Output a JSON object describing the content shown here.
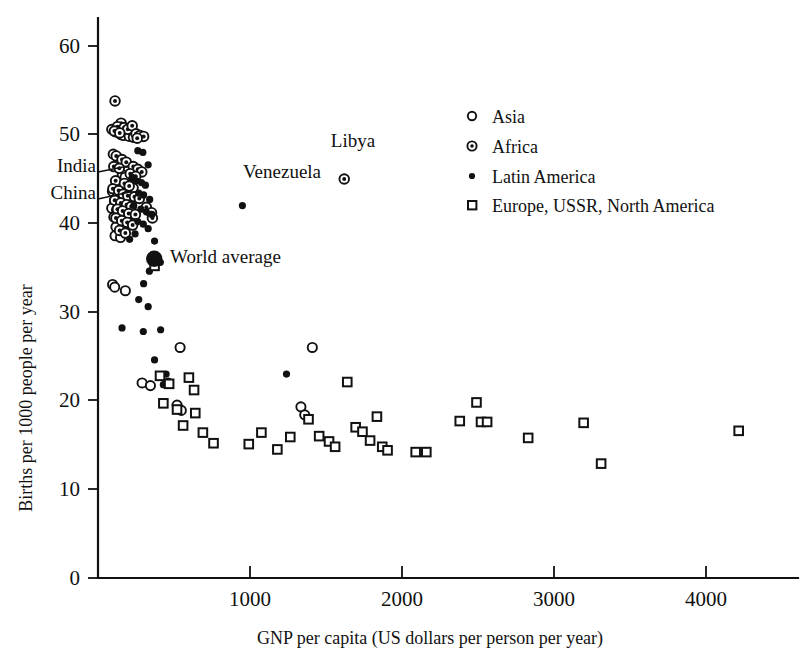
{
  "chart_data": {
    "type": "scatter",
    "title": "",
    "xlabel": "GNP per capita (US dollars per person per year)",
    "ylabel": "Births per 1000 people per year",
    "xlim": [
      0,
      4650
    ],
    "ylim": [
      0,
      62
    ],
    "xticks": [
      0,
      1000,
      2000,
      3000,
      4000
    ],
    "xtick_labels": [
      "",
      "1000",
      "2000",
      "3000",
      "4000"
    ],
    "yticks": [
      0,
      10,
      20,
      30,
      40,
      50,
      60
    ],
    "ytick_labels": [
      "0",
      "10",
      "20",
      "30",
      "40",
      "50",
      "60"
    ],
    "grid": false,
    "legend_position": "upper-right",
    "legend": [
      {
        "key": "asia",
        "label": "Asia",
        "marker": "open-circle"
      },
      {
        "key": "africa",
        "label": "Africa",
        "marker": "circle-with-dot"
      },
      {
        "key": "latin",
        "label": "Latin America",
        "marker": "filled-dot"
      },
      {
        "key": "europe",
        "label": "Europe, USSR, North America",
        "marker": "open-square"
      }
    ],
    "series": [
      {
        "name": "Asia",
        "marker": "open-circle",
        "points": [
          [
            90,
            50.6
          ],
          [
            118,
            50.3
          ],
          [
            150,
            50.0
          ],
          [
            168,
            49.9
          ],
          [
            205,
            49.8
          ],
          [
            232,
            49.7
          ],
          [
            100,
            47.8
          ],
          [
            135,
            47.0
          ],
          [
            160,
            45.5
          ],
          [
            178,
            45.2
          ],
          [
            120,
            44.6
          ],
          [
            145,
            44.3
          ],
          [
            200,
            44.4
          ],
          [
            232,
            44.0
          ],
          [
            95,
            43.6
          ],
          [
            128,
            43.4
          ],
          [
            175,
            43.5
          ],
          [
            148,
            43.0
          ],
          [
            190,
            42.9
          ],
          [
            108,
            42.5
          ],
          [
            132,
            42.4
          ],
          [
            166,
            42.2
          ],
          [
            205,
            42.0
          ],
          [
            220,
            42.0
          ],
          [
            90,
            41.7
          ],
          [
            122,
            41.5
          ],
          [
            152,
            41.4
          ],
          [
            183,
            41.2
          ],
          [
            215,
            41.0
          ],
          [
            104,
            40.7
          ],
          [
            140,
            40.5
          ],
          [
            172,
            40.4
          ],
          [
            198,
            40.2
          ],
          [
            118,
            39.6
          ],
          [
            158,
            39.4
          ],
          [
            112,
            38.6
          ],
          [
            148,
            38.4
          ],
          [
            96,
            33.1
          ],
          [
            110,
            32.8
          ],
          [
            180,
            32.4
          ],
          [
            370,
            36.2
          ],
          [
            290,
            22.0
          ],
          [
            345,
            21.7
          ],
          [
            540,
            26.0
          ],
          [
            520,
            19.5
          ],
          [
            548,
            18.9
          ],
          [
            1410,
            26.0
          ],
          [
            1335,
            19.3
          ],
          [
            1360,
            18.4
          ]
        ]
      },
      {
        "name": "Africa",
        "marker": "circle-with-dot",
        "points": [
          [
            112,
            53.8
          ],
          [
            152,
            51.3
          ],
          [
            128,
            50.9
          ],
          [
            172,
            50.8
          ],
          [
            196,
            50.6
          ],
          [
            108,
            50.4
          ],
          [
            143,
            50.2
          ],
          [
            225,
            51.0
          ],
          [
            250,
            50.1
          ],
          [
            276,
            49.9
          ],
          [
            300,
            49.8
          ],
          [
            258,
            49.6
          ],
          [
            120,
            47.6
          ],
          [
            158,
            47.2
          ],
          [
            186,
            46.9
          ],
          [
            104,
            46.4
          ],
          [
            140,
            46.2
          ],
          [
            232,
            46.4
          ],
          [
            262,
            46.1
          ],
          [
            288,
            45.8
          ],
          [
            212,
            45.6
          ],
          [
            248,
            45.3
          ],
          [
            116,
            44.8
          ],
          [
            174,
            44.5
          ],
          [
            205,
            44.2
          ],
          [
            98,
            43.9
          ],
          [
            136,
            43.7
          ],
          [
            166,
            43.3
          ],
          [
            196,
            43.1
          ],
          [
            240,
            43.0
          ],
          [
            272,
            42.8
          ],
          [
            110,
            42.6
          ],
          [
            150,
            42.3
          ],
          [
            188,
            42.1
          ],
          [
            218,
            41.9
          ],
          [
            128,
            41.6
          ],
          [
            162,
            41.4
          ],
          [
            202,
            41.1
          ],
          [
            246,
            41.0
          ],
          [
            118,
            40.6
          ],
          [
            156,
            40.3
          ],
          [
            192,
            40.1
          ],
          [
            228,
            39.8
          ],
          [
            142,
            39.2
          ],
          [
            180,
            38.9
          ],
          [
            318,
            41.8
          ],
          [
            352,
            41.2
          ],
          [
            358,
            40.6
          ],
          [
            1620,
            45.0
          ]
        ]
      },
      {
        "name": "Latin America",
        "marker": "filled-dot",
        "points": [
          [
            262,
            48.2
          ],
          [
            295,
            48.0
          ],
          [
            330,
            46.6
          ],
          [
            225,
            45.2
          ],
          [
            252,
            44.8
          ],
          [
            286,
            44.6
          ],
          [
            312,
            44.3
          ],
          [
            268,
            43.4
          ],
          [
            300,
            43.2
          ],
          [
            340,
            42.7
          ],
          [
            235,
            42.0
          ],
          [
            282,
            41.6
          ],
          [
            318,
            41.3
          ],
          [
            355,
            41.0
          ],
          [
            262,
            40.2
          ],
          [
            298,
            39.9
          ],
          [
            330,
            39.4
          ],
          [
            244,
            38.8
          ],
          [
            208,
            38.2
          ],
          [
            372,
            38.0
          ],
          [
            410,
            35.6
          ],
          [
            338,
            34.6
          ],
          [
            300,
            33.2
          ],
          [
            268,
            31.4
          ],
          [
            330,
            30.6
          ],
          [
            158,
            28.2
          ],
          [
            412,
            28.0
          ],
          [
            298,
            27.8
          ],
          [
            372,
            24.6
          ],
          [
            448,
            23.0
          ],
          [
            462,
            22.2
          ],
          [
            430,
            21.8
          ],
          [
            950,
            42.0
          ],
          [
            1240,
            23.0
          ]
        ]
      },
      {
        "name": "Europe, USSR, North America",
        "marker": "open-square",
        "points": [
          [
            372,
            35.2
          ],
          [
            408,
            22.8
          ],
          [
            468,
            21.9
          ],
          [
            598,
            22.6
          ],
          [
            632,
            21.2
          ],
          [
            430,
            19.7
          ],
          [
            520,
            19.0
          ],
          [
            640,
            18.6
          ],
          [
            560,
            17.2
          ],
          [
            690,
            16.4
          ],
          [
            760,
            15.2
          ],
          [
            992,
            15.1
          ],
          [
            1075,
            16.4
          ],
          [
            1180,
            14.5
          ],
          [
            1265,
            15.9
          ],
          [
            1385,
            17.9
          ],
          [
            1455,
            16.0
          ],
          [
            1520,
            15.4
          ],
          [
            1560,
            14.8
          ],
          [
            1640,
            22.1
          ],
          [
            1695,
            17.0
          ],
          [
            1740,
            16.5
          ],
          [
            1790,
            15.5
          ],
          [
            1835,
            18.2
          ],
          [
            1870,
            14.8
          ],
          [
            1905,
            14.4
          ],
          [
            2090,
            14.2
          ],
          [
            2160,
            14.2
          ],
          [
            2380,
            17.7
          ],
          [
            2490,
            19.8
          ],
          [
            2520,
            17.6
          ],
          [
            2560,
            17.6
          ],
          [
            2830,
            15.8
          ],
          [
            3195,
            17.5
          ],
          [
            3310,
            12.9
          ],
          [
            4215,
            16.6
          ]
        ]
      },
      {
        "name": "World average",
        "marker": "large-filled-circle",
        "points": [
          [
            370,
            36.0
          ]
        ]
      }
    ],
    "annotations": [
      {
        "text": "India",
        "point": [
          180,
          43.5
        ],
        "text_anchor": "end"
      },
      {
        "text": "China",
        "point": [
          220,
          42.0
        ],
        "text_anchor": "end"
      },
      {
        "text": "Venezuela",
        "point": [
          950,
          42.0
        ],
        "text_anchor": "middle"
      },
      {
        "text": "Libya",
        "point": [
          1620,
          45.0
        ],
        "text_anchor": "middle"
      },
      {
        "text": "World average",
        "point": [
          370,
          36.0
        ],
        "text_anchor": "start"
      }
    ]
  },
  "labels": {
    "xlabel": "GNP per capita (US dollars per person per year)",
    "ylabel": "Births per 1000 people per year",
    "annot_india": "India",
    "annot_china": "China",
    "annot_venezuela": "Venezuela",
    "annot_libya": "Libya",
    "annot_world_average": "World average",
    "legend_asia": "Asia",
    "legend_africa": "Africa",
    "legend_latin": "Latin America",
    "legend_europe": "Europe, USSR, North America",
    "xtick_1000": "1000",
    "xtick_2000": "2000",
    "xtick_3000": "3000",
    "xtick_4000": "4000",
    "ytick_0": "0",
    "ytick_10": "10",
    "ytick_20": "20",
    "ytick_30": "30",
    "ytick_40": "40",
    "ytick_50": "50",
    "ytick_60": "60"
  },
  "colors": {
    "ink": "#111111",
    "background": "#ffffff"
  }
}
